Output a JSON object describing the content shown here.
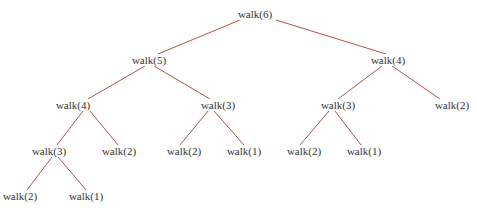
{
  "diagram": {
    "type": "tree",
    "title": "",
    "edge_color": "#b5524a",
    "text_color": "#333333",
    "nodes": [
      {
        "id": "n0",
        "label": "walk(6)",
        "x": 255,
        "y": 14
      },
      {
        "id": "n1",
        "label": "walk(5)",
        "x": 149,
        "y": 60
      },
      {
        "id": "n2",
        "label": "walk(4)",
        "x": 388,
        "y": 60
      },
      {
        "id": "n3",
        "label": "walk(4)",
        "x": 73,
        "y": 105
      },
      {
        "id": "n4",
        "label": "walk(3)",
        "x": 218,
        "y": 105
      },
      {
        "id": "n5",
        "label": "walk(3)",
        "x": 338,
        "y": 105
      },
      {
        "id": "n6",
        "label": "walk(2)",
        "x": 452,
        "y": 105
      },
      {
        "id": "n7",
        "label": "walk(3)",
        "x": 49,
        "y": 151
      },
      {
        "id": "n8",
        "label": "walk(2)",
        "x": 119,
        "y": 151
      },
      {
        "id": "n9",
        "label": "walk(2)",
        "x": 184,
        "y": 151
      },
      {
        "id": "n10",
        "label": "walk(1)",
        "x": 244,
        "y": 151
      },
      {
        "id": "n11",
        "label": "walk(2)",
        "x": 304,
        "y": 151
      },
      {
        "id": "n12",
        "label": "walk(1)",
        "x": 364,
        "y": 151
      },
      {
        "id": "n13",
        "label": "walk(2)",
        "x": 20,
        "y": 196
      },
      {
        "id": "n14",
        "label": "walk(1)",
        "x": 86,
        "y": 196
      }
    ],
    "edges": [
      {
        "from": "n0",
        "to": "n1",
        "x1": 240,
        "y1": 20,
        "x2": 158,
        "y2": 54
      },
      {
        "from": "n0",
        "to": "n2",
        "x1": 276,
        "y1": 20,
        "x2": 386,
        "y2": 54
      },
      {
        "from": "n1",
        "to": "n3",
        "x1": 145,
        "y1": 66,
        "x2": 88,
        "y2": 99
      },
      {
        "from": "n1",
        "to": "n4",
        "x1": 154,
        "y1": 66,
        "x2": 210,
        "y2": 99
      },
      {
        "from": "n2",
        "to": "n5",
        "x1": 382,
        "y1": 66,
        "x2": 338,
        "y2": 99
      },
      {
        "from": "n2",
        "to": "n6",
        "x1": 392,
        "y1": 66,
        "x2": 440,
        "y2": 99
      },
      {
        "from": "n3",
        "to": "n7",
        "x1": 83,
        "y1": 111,
        "x2": 57,
        "y2": 145
      },
      {
        "from": "n3",
        "to": "n8",
        "x1": 90,
        "y1": 111,
        "x2": 118,
        "y2": 145
      },
      {
        "from": "n4",
        "to": "n9",
        "x1": 208,
        "y1": 111,
        "x2": 180,
        "y2": 145
      },
      {
        "from": "n4",
        "to": "n10",
        "x1": 214,
        "y1": 111,
        "x2": 244,
        "y2": 145
      },
      {
        "from": "n5",
        "to": "n11",
        "x1": 329,
        "y1": 111,
        "x2": 300,
        "y2": 145
      },
      {
        "from": "n5",
        "to": "n12",
        "x1": 335,
        "y1": 111,
        "x2": 361,
        "y2": 145
      },
      {
        "from": "n7",
        "to": "n13",
        "x1": 52,
        "y1": 157,
        "x2": 27,
        "y2": 190
      },
      {
        "from": "n7",
        "to": "n14",
        "x1": 58,
        "y1": 157,
        "x2": 86,
        "y2": 190
      }
    ]
  }
}
